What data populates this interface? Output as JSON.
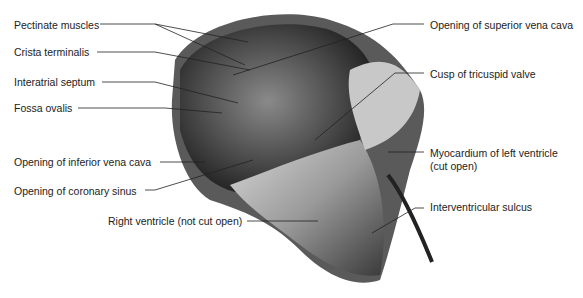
{
  "figure": {
    "labels": [
      {
        "id": "pectinate",
        "text": "Pectinate muscles",
        "x": 14,
        "y": 19
      },
      {
        "id": "crista",
        "text": "Crista terminalis",
        "x": 14,
        "y": 46
      },
      {
        "id": "septum",
        "text": "Interatrial septum",
        "x": 14,
        "y": 76
      },
      {
        "id": "fossa",
        "text": "Fossa ovalis",
        "x": 14,
        "y": 102
      },
      {
        "id": "ivc",
        "text": "Opening of inferior vena cava",
        "x": 14,
        "y": 156
      },
      {
        "id": "coronary",
        "text": "Opening of coronary sinus",
        "x": 14,
        "y": 185
      },
      {
        "id": "rv",
        "text": "Right ventricle (not cut open)",
        "x": 108,
        "y": 215
      },
      {
        "id": "svc",
        "text": "Opening of superior vena cava",
        "x": 430,
        "y": 19
      },
      {
        "id": "tricuspid",
        "text": "Cusp of tricuspid valve",
        "x": 430,
        "y": 68
      },
      {
        "id": "myocardium1",
        "text": "Myocardium of left ventricle",
        "x": 430,
        "y": 147
      },
      {
        "id": "myocardium2",
        "text": "(cut open)",
        "x": 430,
        "y": 160
      },
      {
        "id": "sulcus",
        "text": "Interventricular sulcus",
        "x": 430,
        "y": 201
      }
    ]
  }
}
